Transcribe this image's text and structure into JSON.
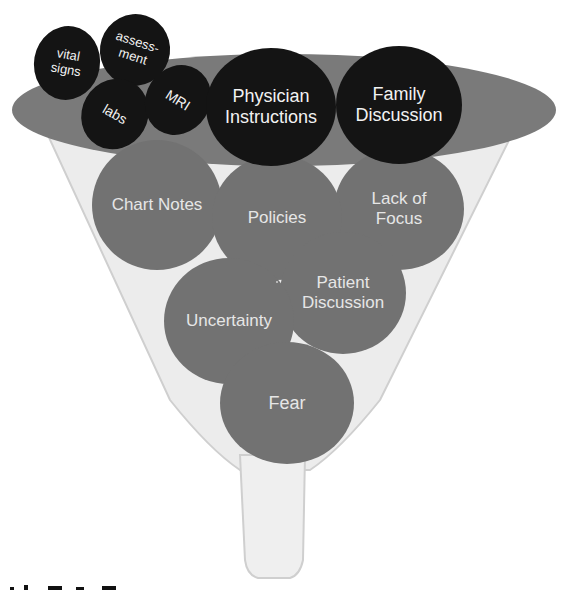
{
  "diagram": {
    "type": "funnel",
    "colors": {
      "funnel_rim": "#7a7a7a",
      "funnel_body": "#e8e8e8",
      "funnel_edge": "#c8c8c8",
      "dark_bubble": "#141414",
      "grey_bubble": "#727272",
      "bubble_text_light": "#f2f2f2"
    },
    "top_bubbles": [
      {
        "id": "vital-signs",
        "label": "vital\nsigns"
      },
      {
        "id": "assessment",
        "label": "assess-\nment"
      },
      {
        "id": "labs",
        "label": "labs"
      },
      {
        "id": "mri",
        "label": "MRI"
      },
      {
        "id": "physician-instructions",
        "label": "Physician\nInstructions"
      },
      {
        "id": "family-discussion",
        "label": "Family\nDiscussion"
      }
    ],
    "funnel_bubbles": [
      {
        "id": "chart-notes",
        "label": "Chart Notes"
      },
      {
        "id": "policies",
        "label": "Policies"
      },
      {
        "id": "lack-of-focus",
        "label": "Lack of\nFocus"
      },
      {
        "id": "patient-discussion",
        "label": "Patient\nDiscussion"
      },
      {
        "id": "uncertainty",
        "label": "Uncertainty"
      },
      {
        "id": "fear",
        "label": "Fear"
      }
    ]
  }
}
